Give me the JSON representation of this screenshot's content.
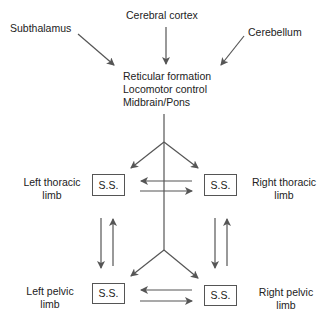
{
  "diagram": {
    "sources": {
      "subthalamus": "Subthalamus",
      "cerebral_cortex": "Cerebral cortex",
      "cerebellum": "Cerebellum"
    },
    "center": {
      "line1": "Reticular formation",
      "line2": "Locomotor control",
      "line3": "Midbrain/Pons"
    },
    "limbs": {
      "left_thoracic": {
        "line1": "Left thoracic",
        "line2": "limb",
        "box": "S.S."
      },
      "right_thoracic": {
        "line1": "Right thoracic",
        "line2": "limb",
        "box": "S.S."
      },
      "left_pelvic": {
        "line1": "Left pelvic",
        "line2": "limb",
        "box": "S.S."
      },
      "right_pelvic": {
        "line1": "Right pelvic",
        "line2": "limb",
        "box": "S.S."
      }
    },
    "colors": {
      "line": "#555555",
      "text": "#222222",
      "background": "#ffffff"
    }
  }
}
